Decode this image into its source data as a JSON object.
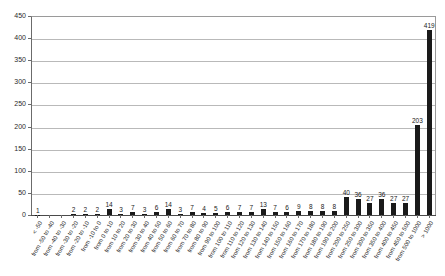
{
  "chart_data": {
    "type": "bar",
    "title": "",
    "xlabel": "",
    "ylabel": "",
    "ylim": [
      0,
      450
    ],
    "yticks": [
      0,
      50,
      100,
      150,
      200,
      250,
      300,
      350,
      400,
      450
    ],
    "grid": true,
    "legend": "none",
    "bar_color": "#1a1a1a",
    "categories": [
      "< -50",
      "from -50 to -40",
      "from -40 to -30",
      "from -30 to -20",
      "from -20 to -10",
      "from -10 to 0",
      "from 0 to 10",
      "from 10 to 20",
      "from 20 to 30",
      "from 30 to 40",
      "from 40 to 50",
      "from 50 to 60",
      "from 60 to 70",
      "from 70 to 80",
      "from 80 to 90",
      "from 90 to 100",
      "from 100 to 110",
      "from 110 to 120",
      "from 120 to 130",
      "from 130 to 140",
      "from 140 to 150",
      "from 150 to 160",
      "from 160 to 170",
      "from 170 to 180",
      "from 180 to 190",
      "from 190 to 200",
      "from 200 to 250",
      "from 250 to 300",
      "from 300 to 350",
      "from 350 to 400",
      "from 400 to 450",
      "from 450 to 500",
      "from 500 to 1000",
      "> 1000"
    ],
    "values": [
      1,
      0,
      0,
      2,
      2,
      2,
      14,
      3,
      7,
      3,
      6,
      14,
      3,
      7,
      4,
      5,
      6,
      7,
      7,
      13,
      7,
      6,
      9,
      8,
      8,
      8,
      40,
      36,
      27,
      36,
      27,
      27,
      203,
      419
    ],
    "value_labels": [
      "1",
      "",
      "",
      "2",
      "2",
      "2",
      "14",
      "3",
      "7",
      "3",
      "6",
      "14",
      "3",
      "7",
      "4",
      "5",
      "6",
      "7",
      "7",
      "13",
      "7",
      "6",
      "9",
      "8",
      "8",
      "8",
      "40",
      "36",
      "27",
      "36",
      "27",
      "27",
      "203",
      "419"
    ]
  }
}
